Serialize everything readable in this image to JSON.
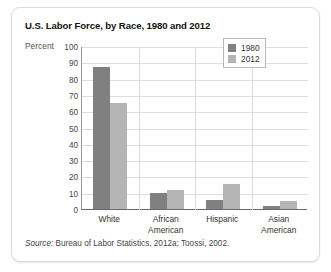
{
  "chart_data": {
    "type": "bar",
    "title": "U.S. Labor Force, by Race, 1980 and 2012",
    "xlabel": "",
    "ylabel": "Percent",
    "ylim": [
      0,
      100
    ],
    "ytick_step": 10,
    "yticks": [
      100,
      90,
      80,
      70,
      60,
      50,
      40,
      30,
      20,
      10,
      0
    ],
    "grid": true,
    "legend_position": "upper right",
    "categories": [
      "White",
      "African American",
      "Hispanic",
      "Asian American"
    ],
    "series": [
      {
        "name": "1980",
        "color": "#808080",
        "values": [
          87,
          10,
          5.5,
          2
        ]
      },
      {
        "name": "2012",
        "color": "#b5b5b5",
        "values": [
          65,
          11.5,
          15.5,
          5
        ]
      }
    ],
    "source_label": "Source:",
    "source_text": " Bureau of Labor Statistics, 2012a; Toossi, 2002."
  }
}
